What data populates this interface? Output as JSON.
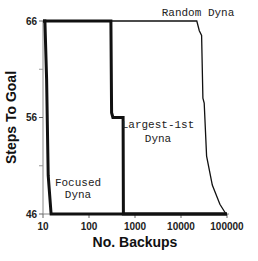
{
  "chart_data": {
    "type": "line",
    "title": "",
    "xlabel": "No. Backups",
    "ylabel": "Steps To Goal",
    "xscale": "log",
    "xlim": [
      10,
      100000
    ],
    "ylim": [
      46,
      66
    ],
    "x_ticks": [
      "10",
      "100",
      "1000",
      "10000",
      "100000"
    ],
    "y_ticks": [
      "46",
      "56",
      "66"
    ],
    "y_minor_ticks": [
      51,
      61
    ],
    "grid": false,
    "legend": "inline labels",
    "series": [
      {
        "name": "Focused Dyna",
        "label_lines": [
          "Focused",
          "Dyna"
        ],
        "stroke": "thick",
        "points": [
          [
            10,
            66
          ],
          [
            11,
            66
          ],
          [
            12,
            60
          ],
          [
            13,
            50
          ],
          [
            15,
            46
          ],
          [
            100000,
            46
          ]
        ]
      },
      {
        "name": "Largest-1st Dyna",
        "label_lines": [
          "Largest-1st",
          "Dyna"
        ],
        "stroke": "thick",
        "points": [
          [
            10,
            66
          ],
          [
            300,
            66
          ],
          [
            310,
            56.5
          ],
          [
            330,
            56
          ],
          [
            550,
            56
          ],
          [
            560,
            46
          ],
          [
            100000,
            46
          ]
        ]
      },
      {
        "name": "Random Dyna",
        "label_lines": [
          "Random Dyna"
        ],
        "stroke": "thin",
        "points": [
          [
            10,
            66
          ],
          [
            22000,
            66
          ],
          [
            25000,
            65
          ],
          [
            28000,
            64.5
          ],
          [
            30000,
            58
          ],
          [
            32000,
            57.5
          ],
          [
            36000,
            52
          ],
          [
            48000,
            49
          ],
          [
            70000,
            47
          ],
          [
            95000,
            46
          ]
        ]
      }
    ]
  },
  "plot_area": {
    "x0": 43,
    "x1": 227,
    "y_top": 21,
    "y_bottom": 214
  }
}
